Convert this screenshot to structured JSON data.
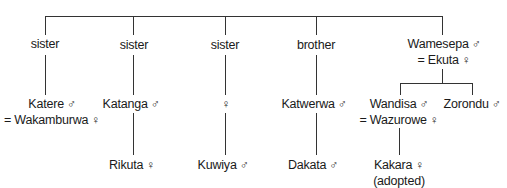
{
  "diagram": {
    "type": "kinship-tree",
    "relations": [
      {
        "label": "sister"
      },
      {
        "label": "sister"
      },
      {
        "label": "sister"
      },
      {
        "label": "brother"
      },
      {
        "label": "Wamesepa",
        "symbol": "♂",
        "spouse": "= Ekuta",
        "spouse_symbol": "♀"
      }
    ],
    "generation2": [
      {
        "name": "Katere",
        "symbol": "♂",
        "spouse": "= Wakamburwa",
        "spouse_symbol": "♀"
      },
      {
        "name": "Katanga",
        "symbol": "♂"
      },
      {
        "name": "",
        "symbol": "♀"
      },
      {
        "name": "Katwerwa",
        "symbol": "♂"
      },
      {
        "name": "Wandisa",
        "symbol": "♂",
        "spouse": "= Wazurowe",
        "spouse_symbol": "♀"
      },
      {
        "name": "Zorondu",
        "symbol": "♂"
      }
    ],
    "generation3": [
      {
        "name": "Rikuta",
        "symbol": "♀"
      },
      {
        "name": "Kuwiya",
        "symbol": "♂"
      },
      {
        "name": "Dakata",
        "symbol": "♂"
      },
      {
        "name": "Kakara",
        "symbol": "♀",
        "note": "(adopted)"
      }
    ]
  }
}
